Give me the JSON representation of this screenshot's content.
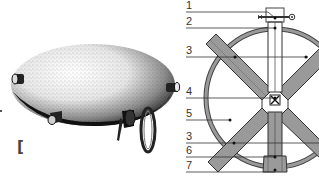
{
  "figure": {
    "left_panel": {
      "description": "stippled illustration of an oval/lenticular vessel with spouts, knobs and a ring handle",
      "bracket_glyph": "["
    },
    "right_panel": {
      "description": "labeled cross-section diagram: circular ring with vertical bar and X-shaped crossing bars",
      "labels": [
        {
          "num": "1",
          "y": 12
        },
        {
          "num": "2",
          "y": 28
        },
        {
          "num": "3",
          "y": 57
        },
        {
          "num": "4",
          "y": 98
        },
        {
          "num": "5",
          "y": 120
        },
        {
          "num": "3",
          "y": 143
        },
        {
          "num": "6",
          "y": 157
        },
        {
          "num": "7",
          "y": 170
        }
      ]
    },
    "colors": {
      "bar_fill": "#9a9a9a",
      "outline": "#333333",
      "ink": "#111111",
      "background": "#ffffff"
    }
  }
}
